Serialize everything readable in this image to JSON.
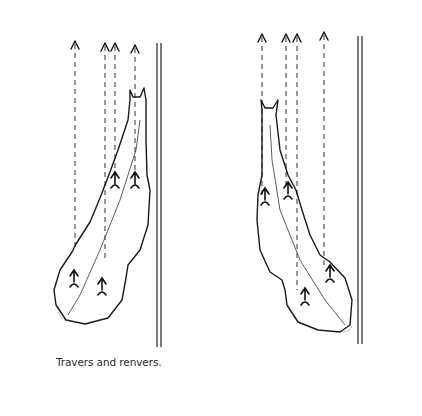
{
  "figure": {
    "caption": "Travers and renvers.",
    "panels": [
      {
        "name": "travers",
        "track_lines_x": [
          75,
          105,
          115,
          135
        ],
        "wall_x": 159
      },
      {
        "name": "renvers",
        "track_lines_x": [
          262,
          286,
          297,
          324
        ],
        "wall_x": 360
      }
    ],
    "colors": {
      "ink": "#1a1a1a",
      "background": "#ffffff"
    }
  }
}
